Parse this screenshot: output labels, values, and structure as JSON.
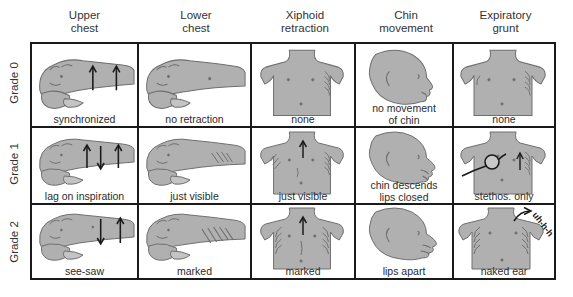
{
  "figure": {
    "accent_color": "#a8a8a8",
    "line_color": "#1a1a1a",
    "text_color": "#2b2b2b"
  },
  "columns": [
    {
      "id": "upper-chest",
      "line1": "Upper",
      "line2": "chest"
    },
    {
      "id": "lower-chest",
      "line1": "Lower",
      "line2": "chest"
    },
    {
      "id": "xiphoid-retraction",
      "line1": "Xiphoid",
      "line2": "retraction"
    },
    {
      "id": "chin-movement",
      "line1": "Chin",
      "line2": "movement"
    },
    {
      "id": "expiratory-grunt",
      "line1": "Expiratory",
      "line2": "grunt"
    }
  ],
  "rows": [
    {
      "id": "grade-0",
      "label": "Grade 0"
    },
    {
      "id": "grade-1",
      "label": "Grade 1"
    },
    {
      "id": "grade-2",
      "label": "Grade 2"
    }
  ],
  "cells": {
    "grade0": {
      "upper_chest": {
        "caption": "synchronized"
      },
      "lower_chest": {
        "caption": "no retraction"
      },
      "xiphoid_retraction": {
        "caption": "none"
      },
      "chin_movement": {
        "caption_line1": "no movement",
        "caption_line2": "of chin"
      },
      "expiratory_grunt": {
        "caption": "none"
      }
    },
    "grade1": {
      "upper_chest": {
        "caption": "lag on inspiration"
      },
      "lower_chest": {
        "caption": "just visible"
      },
      "xiphoid_retraction": {
        "caption": "just visible"
      },
      "chin_movement": {
        "caption_line1": "chin descends",
        "caption_line2": "lips closed"
      },
      "expiratory_grunt": {
        "caption": "stethos. only"
      }
    },
    "grade2": {
      "upper_chest": {
        "caption": "see-saw"
      },
      "lower_chest": {
        "caption": "marked"
      },
      "xiphoid_retraction": {
        "caption": "marked"
      },
      "chin_movement": {
        "caption": "lips apart"
      },
      "expiratory_grunt": {
        "caption": "naked ear",
        "annotation": "uh-h-h"
      }
    }
  }
}
